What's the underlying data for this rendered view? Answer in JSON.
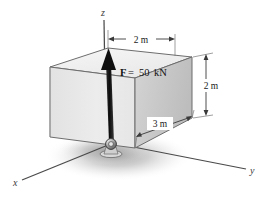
{
  "figure": {
    "background_color": "#ffffff"
  },
  "axes": {
    "z": {
      "label": "z",
      "direction": "up"
    },
    "x": {
      "label": "x",
      "direction": "down-left"
    },
    "y": {
      "label": "y",
      "direction": "down-right"
    }
  },
  "force": {
    "symbol": "F",
    "equals": " = ",
    "magnitude": "50",
    "unit": "kN",
    "full_label": "F = 50 kN",
    "color": "#141414",
    "direction": "vertical-up"
  },
  "dimensions": [
    {
      "id": "top-width",
      "label": "2 m",
      "orientation": "horizontal",
      "location": "top"
    },
    {
      "id": "right-height",
      "label": "2 m",
      "orientation": "vertical",
      "location": "right"
    },
    {
      "id": "bottom-depth",
      "label": "3 m",
      "orientation": "oblique",
      "location": "bottom-right"
    }
  ],
  "box": {
    "face_left_color": "#e8e8e8",
    "face_right_color": "#c9c9c9",
    "face_top_color": "#f2f2f2",
    "edge_color": "#6d6d6d"
  },
  "support": {
    "type": "ball-and-socket",
    "location": "origin"
  },
  "shadow": {
    "color": "#b4b4b4"
  }
}
